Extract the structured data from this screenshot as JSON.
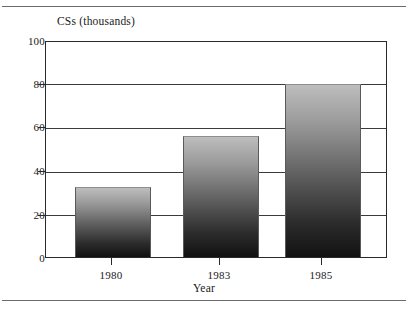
{
  "chart_data": {
    "type": "bar",
    "title": "",
    "categories": [
      "1980",
      "1983",
      "1985"
    ],
    "values": [
      32,
      56,
      80
    ],
    "series": [
      {
        "name": "CSs (thousands)",
        "values": [
          32,
          56,
          80
        ]
      }
    ],
    "xlabel": "Year",
    "ylabel": "CSs (thousands)",
    "ylim": [
      0,
      100
    ],
    "yticks": [
      0,
      20,
      40,
      60,
      80,
      100
    ],
    "ytick_labels": [
      "0",
      "20",
      "40",
      "60",
      "80",
      "100"
    ],
    "grid": true,
    "grid_axis": "y",
    "legend": false,
    "legend_position": "none",
    "bar_fill": "gradient-gray-to-black",
    "colors": {
      "bar_top": "#bdbdbd",
      "bar_bottom": "#111111",
      "axis": "#2a2a2a",
      "grid": "#3a3a3a",
      "background": "#ffffff",
      "text": "#1a1a1a"
    }
  },
  "figure": {
    "y_axis_title": "CSs (thousands)",
    "x_axis_title": "Year",
    "tick_0": "0",
    "tick_20": "20",
    "tick_40": "40",
    "tick_60": "60",
    "tick_80": "80",
    "tick_100": "100",
    "cat_0": "1980",
    "cat_1": "1983",
    "cat_2": "1985"
  }
}
